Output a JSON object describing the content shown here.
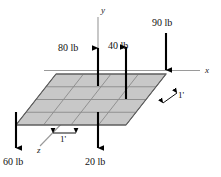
{
  "figure": {
    "background": "#ffffff",
    "plate_fill": "#c8c8c8",
    "plate_stroke": "#6b6b6b",
    "arrow_color": "#000000",
    "axis_color": "#8a8a8a"
  },
  "axes": [
    {
      "name": "y-axis",
      "label": "y"
    },
    {
      "name": "x-axis",
      "label": "x"
    },
    {
      "name": "z-axis",
      "label": "z"
    }
  ],
  "forces": [
    {
      "name": "force-80lb",
      "label": "80 lb",
      "magnitude": 80,
      "unit": "lb",
      "direction": "up"
    },
    {
      "name": "force-40lb",
      "label": "40 lb",
      "magnitude": 40,
      "unit": "lb",
      "direction": "up"
    },
    {
      "name": "force-90lb",
      "label": "90 lb",
      "magnitude": 90,
      "unit": "lb",
      "direction": "down"
    },
    {
      "name": "force-60lb",
      "label": "60 lb",
      "magnitude": 60,
      "unit": "lb",
      "direction": "down"
    },
    {
      "name": "force-20lb",
      "label": "20 lb",
      "magnitude": 20,
      "unit": "lb",
      "direction": "down"
    }
  ],
  "dimensions": [
    {
      "name": "dimension-front",
      "label": "1'",
      "value": "1'"
    },
    {
      "name": "dimension-right",
      "label": "1'",
      "value": "1'"
    }
  ],
  "grid": {
    "rows": 4,
    "columns": 4
  }
}
